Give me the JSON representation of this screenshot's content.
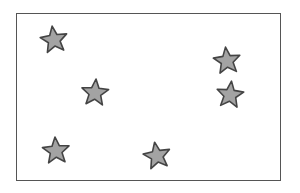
{
  "scene": {
    "description": "Rectangular frame containing six gray stars",
    "star_count": 6,
    "colors": {
      "star_fill": "#a3a3a3",
      "star_stroke": "#444444",
      "frame_border": "#555555",
      "background": "#ffffff"
    }
  }
}
